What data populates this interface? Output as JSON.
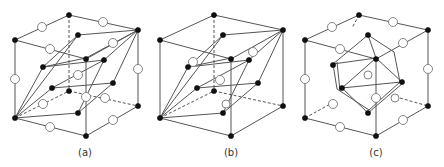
{
  "figure": {
    "panels": [
      {
        "id": "a",
        "label": "(a)",
        "description": "Cube with body-diagonal rhombohedral primitive cell; filled atoms at corners, open circles at edge midpoints and center"
      },
      {
        "id": "b",
        "label": "(b)",
        "description": "Cube with rhombohedral primitive cell; filled atoms at corners and face-centered positions, a few open circles inside"
      },
      {
        "id": "c",
        "label": "(c)",
        "description": "Cube with hexagonal prism (Wigner-Seitz style) cell inside; filled atoms at corners, open circles at edge midpoints"
      }
    ],
    "legend": {
      "filled_atom": "black sphere",
      "open_atom": "open circle"
    },
    "colors": {
      "line": "#555555",
      "filled": "#111111",
      "open_stroke": "#777777"
    }
  }
}
